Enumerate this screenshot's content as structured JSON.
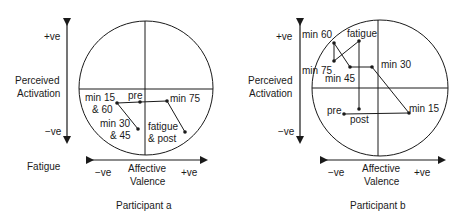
{
  "panels": [
    {
      "title": "Participant a",
      "y_axis": {
        "label_line1": "Perceived",
        "label_line2": "Activation",
        "top": "+ve",
        "bottom": "−ve"
      },
      "x_axis": {
        "label_line1": "Affective",
        "label_line2": "Valence",
        "left": "−ve",
        "right": "+ve"
      },
      "side_label": "Fatigue",
      "points": [
        {
          "label1": "min 15",
          "label2": "& 60"
        },
        {
          "label1": "pre",
          "label2": ""
        },
        {
          "label1": "min 75",
          "label2": ""
        },
        {
          "label1": "min 30",
          "label2": "& 45"
        },
        {
          "label1": "fatigue",
          "label2": "& post"
        }
      ]
    },
    {
      "title": "Participant b",
      "y_axis": {
        "label_line1": "Perceived",
        "label_line2": "Activation",
        "top": "+ve",
        "bottom": "−ve"
      },
      "x_axis": {
        "label_line1": "Affective",
        "label_line2": "Valence",
        "left": "−ve",
        "right": "+ve"
      },
      "points": [
        {
          "label1": "min 60"
        },
        {
          "label1": "fatigue"
        },
        {
          "label1": "min 75"
        },
        {
          "label1": "min 45"
        },
        {
          "label1": "min 30"
        },
        {
          "label1": "min 15"
        },
        {
          "label1": "pre"
        },
        {
          "label1": "post"
        }
      ]
    }
  ],
  "colors": {
    "line": "#1a1a1a",
    "background": "#ffffff"
  }
}
